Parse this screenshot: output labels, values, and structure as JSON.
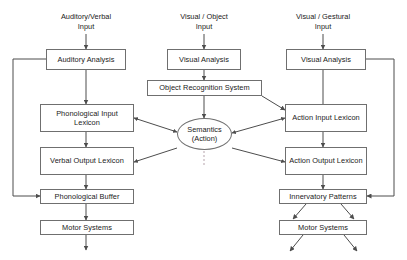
{
  "diagram": {
    "colors": {
      "stroke": "#6f6f6f",
      "arrow": "#4d4d4d",
      "text": "#1a1a1a",
      "background": "#ffffff",
      "dashed": "#b0a0a8"
    },
    "input_labels": [
      {
        "id": "input-auditory-verbal",
        "line1": "Auditory/Verbal",
        "line2": "Input"
      },
      {
        "id": "input-visual-object",
        "line1": "Visual / Object",
        "line2": "Input"
      },
      {
        "id": "input-visual-gestural",
        "line1": "Visual / Gestural",
        "line2": "Input"
      }
    ],
    "nodes": [
      {
        "id": "auditory-analysis",
        "label": "Auditory Analysis",
        "shape": "box"
      },
      {
        "id": "visual-analysis-object",
        "label": "Visual Analysis",
        "shape": "box"
      },
      {
        "id": "visual-analysis-gestural",
        "label": "Visual Analysis",
        "shape": "box"
      },
      {
        "id": "object-recognition-system",
        "label": "Object Recognition System",
        "shape": "box"
      },
      {
        "id": "phonological-input-lexicon",
        "label": "Phonological Input Lexicon",
        "shape": "box"
      },
      {
        "id": "action-input-lexicon",
        "label": "Action Input Lexicon",
        "shape": "box"
      },
      {
        "id": "semantics",
        "label": "Semantics",
        "sublabel": "(Action)",
        "shape": "ellipse"
      },
      {
        "id": "verbal-output-lexicon",
        "label": "Verbal Output Lexicon",
        "shape": "box"
      },
      {
        "id": "action-output-lexicon",
        "label": "Action Output Lexicon",
        "shape": "box"
      },
      {
        "id": "phonological-buffer",
        "label": "Phonological Buffer",
        "shape": "box"
      },
      {
        "id": "innervatory-patterns",
        "label": "Innervatory Patterns",
        "shape": "box"
      },
      {
        "id": "motor-systems-left",
        "label": "Motor Systems",
        "shape": "box"
      },
      {
        "id": "motor-systems-right",
        "label": "Motor Systems",
        "shape": "box"
      }
    ],
    "edges": [
      {
        "from": "input-auditory-verbal",
        "to": "auditory-analysis",
        "style": "solid",
        "arrows": "end"
      },
      {
        "from": "input-visual-object",
        "to": "visual-analysis-object",
        "style": "solid",
        "arrows": "end"
      },
      {
        "from": "input-visual-gestural",
        "to": "visual-analysis-gestural",
        "style": "solid",
        "arrows": "end"
      },
      {
        "from": "auditory-analysis",
        "to": "phonological-input-lexicon",
        "style": "solid",
        "arrows": "end"
      },
      {
        "from": "auditory-analysis",
        "to": "phonological-buffer",
        "style": "solid",
        "arrows": "end",
        "route": "left-loop"
      },
      {
        "from": "visual-analysis-object",
        "to": "object-recognition-system",
        "style": "solid",
        "arrows": "end"
      },
      {
        "from": "visual-analysis-gestural",
        "to": "action-input-lexicon",
        "style": "solid",
        "arrows": "end"
      },
      {
        "from": "visual-analysis-gestural",
        "to": "innervatory-patterns",
        "style": "solid",
        "arrows": "end",
        "route": "right-loop"
      },
      {
        "from": "object-recognition-system",
        "to": "semantics",
        "style": "solid",
        "arrows": "end"
      },
      {
        "from": "object-recognition-system",
        "to": "action-input-lexicon",
        "style": "solid",
        "arrows": "end"
      },
      {
        "from": "phonological-input-lexicon",
        "to": "semantics",
        "style": "solid",
        "arrows": "both"
      },
      {
        "from": "phonological-input-lexicon",
        "to": "verbal-output-lexicon",
        "style": "solid",
        "arrows": "end"
      },
      {
        "from": "action-input-lexicon",
        "to": "semantics",
        "style": "solid",
        "arrows": "both"
      },
      {
        "from": "action-input-lexicon",
        "to": "action-output-lexicon",
        "style": "solid",
        "arrows": "end"
      },
      {
        "from": "semantics",
        "to": "verbal-output-lexicon",
        "style": "solid",
        "arrows": "end"
      },
      {
        "from": "semantics",
        "to": "action-output-lexicon",
        "style": "solid",
        "arrows": "end"
      },
      {
        "from": "verbal-output-lexicon",
        "to": "phonological-buffer",
        "style": "solid",
        "arrows": "end"
      },
      {
        "from": "action-output-lexicon",
        "to": "innervatory-patterns",
        "style": "solid",
        "arrows": "end"
      },
      {
        "from": "phonological-buffer",
        "to": "motor-systems-left",
        "style": "solid",
        "arrows": "end"
      },
      {
        "from": "innervatory-patterns",
        "to": "motor-systems-right",
        "style": "solid",
        "arrows": "end",
        "count": 2
      },
      {
        "from": "motor-systems-left",
        "to": "output",
        "style": "solid",
        "arrows": "end"
      },
      {
        "from": "motor-systems-right",
        "to": "output",
        "style": "solid",
        "arrows": "end",
        "count": 2
      },
      {
        "from": "semantics",
        "to": "semantics-divider",
        "style": "dashed",
        "arrows": "none"
      }
    ]
  }
}
